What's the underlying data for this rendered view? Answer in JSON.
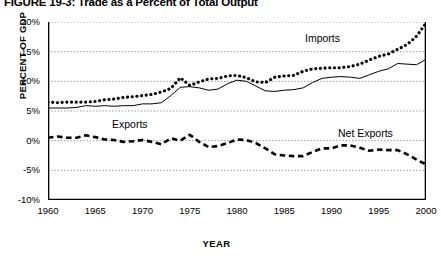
{
  "title": "FIGURE 19-3: Trade as a Percent of Total Output",
  "axes": {
    "ylabel": "PERCENT OF GDP",
    "xlabel": "YEAR",
    "yticks": [
      "20%",
      "15%",
      "10%",
      "5%",
      "0%",
      "-5%",
      "-10%"
    ],
    "xticks": [
      "1960",
      "1965",
      "1970",
      "1975",
      "1980",
      "1985",
      "1990",
      "1995",
      "2000"
    ]
  },
  "labels": {
    "imports": "Imports",
    "exports": "Exports",
    "net_exports": "Net Exports"
  },
  "colors": {
    "line": "#000000",
    "grid": "#999999",
    "background": "#ffffff"
  },
  "chart_data": {
    "type": "line",
    "title": "FIGURE 19-3: Trade as a Percent of Total Output",
    "xlabel": "YEAR",
    "ylabel": "PERCENT OF GDP",
    "xlim": [
      1960,
      2000
    ],
    "ylim": [
      -10,
      20
    ],
    "grid": true,
    "legend": "inline-annotations",
    "x": [
      1960,
      1961,
      1962,
      1963,
      1964,
      1965,
      1966,
      1967,
      1968,
      1969,
      1970,
      1971,
      1972,
      1973,
      1974,
      1975,
      1976,
      1977,
      1978,
      1979,
      1980,
      1981,
      1982,
      1983,
      1984,
      1985,
      1986,
      1987,
      1988,
      1989,
      1990,
      1991,
      1992,
      1993,
      1994,
      1995,
      1996,
      1997,
      1998,
      1999,
      2000
    ],
    "series": [
      {
        "name": "Imports",
        "style": "dotted-thick",
        "values": [
          6.5,
          6.4,
          6.5,
          6.5,
          6.5,
          6.6,
          6.9,
          7.0,
          7.3,
          7.4,
          7.6,
          7.8,
          8.2,
          8.8,
          10.6,
          9.3,
          9.9,
          10.4,
          10.5,
          10.9,
          11.0,
          10.6,
          9.9,
          9.8,
          10.7,
          10.9,
          11.0,
          11.7,
          12.1,
          12.2,
          12.3,
          12.3,
          12.5,
          12.9,
          13.6,
          14.2,
          14.6,
          15.4,
          16.2,
          17.6,
          19.8
        ]
      },
      {
        "name": "Exports",
        "style": "solid-thin",
        "values": [
          5.5,
          5.5,
          5.5,
          5.6,
          5.9,
          5.8,
          5.9,
          5.8,
          5.9,
          5.9,
          6.2,
          6.2,
          6.4,
          7.6,
          9.0,
          9.1,
          8.9,
          8.5,
          8.7,
          9.6,
          10.2,
          10.0,
          9.2,
          8.4,
          8.3,
          8.5,
          8.6,
          8.9,
          9.8,
          10.5,
          10.7,
          10.8,
          10.7,
          10.5,
          11.1,
          11.7,
          12.1,
          13.0,
          12.9,
          12.8,
          13.7
        ]
      },
      {
        "name": "Net Exports",
        "style": "dashed",
        "values": [
          0.5,
          0.7,
          0.5,
          0.5,
          0.9,
          0.6,
          0.2,
          0.1,
          -0.2,
          -0.1,
          0.1,
          -0.2,
          -0.6,
          0.4,
          0.0,
          1.0,
          -0.2,
          -1.1,
          -0.9,
          -0.4,
          0.2,
          0.1,
          -0.4,
          -1.3,
          -2.3,
          -2.5,
          -2.6,
          -2.6,
          -1.9,
          -1.3,
          -1.3,
          -0.8,
          -0.8,
          -1.2,
          -1.7,
          -1.5,
          -1.6,
          -1.6,
          -2.3,
          -3.2,
          -4.0
        ]
      }
    ]
  }
}
